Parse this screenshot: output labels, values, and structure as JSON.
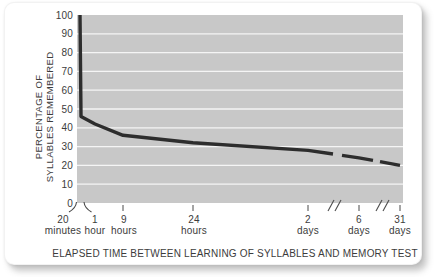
{
  "chart_data": {
    "type": "line",
    "xlabel": "ELAPSED TIME BETWEEN LEARNING OF SYLLABLES AND MEMORY TEST",
    "ylabel_line1": "PERCENTAGE OF",
    "ylabel_line2": "SYLLABLES REMEMBERED",
    "ylim": [
      0,
      100
    ],
    "y_ticks": [
      100,
      90,
      80,
      70,
      60,
      50,
      40,
      30,
      20,
      10,
      0
    ],
    "x_ticks": [
      {
        "line1": "20",
        "line2": "minutes"
      },
      {
        "line1": "1",
        "line2": "hour"
      },
      {
        "line1": "9",
        "line2": "hours"
      },
      {
        "line1": "24",
        "line2": "hours"
      },
      {
        "line1": "2",
        "line2": "days"
      },
      {
        "line1": "6",
        "line2": "days"
      },
      {
        "line1": "31",
        "line2": "days"
      }
    ],
    "series": [
      {
        "name": "percentage of syllables remembered (forgetting curve)",
        "points": [
          {
            "time": "immediately after learning",
            "value": 100
          },
          {
            "time": "20 minutes",
            "value": 46
          },
          {
            "time": "1 hour",
            "value": 42
          },
          {
            "time": "9 hours",
            "value": 36
          },
          {
            "time": "24 hours",
            "value": 32
          },
          {
            "time": "2 days",
            "value": 28
          },
          {
            "time": "6 days",
            "value": 24
          },
          {
            "time": "31 days",
            "value": 20
          }
        ]
      }
    ],
    "axis_breaks": [
      "origin break between 20 minutes and 1 hour (curved marks)",
      "slash break between 2 days and 6 days",
      "slash break between 6 days and 31 days"
    ],
    "curve_gaps_note": "curve is drawn with gaps where the x-axis scale breaks occur",
    "grid": "horizontal white gridlines every 10 units",
    "legend": "none",
    "colors": {
      "plot_background": "#c8c8c8",
      "gridline": "#f5f5f5",
      "curve": "#2d2d2d",
      "text": "#3c3c3c",
      "card_background": "#ffffff",
      "page_background": "#ffffff"
    }
  }
}
